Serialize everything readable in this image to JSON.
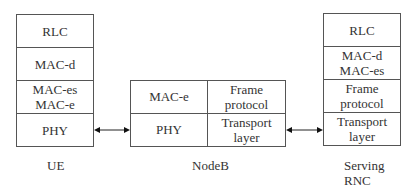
{
  "ue": {
    "layers": [
      "RLC",
      "MAC-d",
      "MAC-es\nMAC-e",
      "PHY"
    ],
    "label": "UE"
  },
  "nodeb": {
    "cells": {
      "top_left": "MAC-e",
      "top_right": "Frame\nprotocol",
      "bottom_left": "PHY",
      "bottom_right": "Transport\nlayer"
    },
    "label": "NodeB"
  },
  "rnc": {
    "layers": [
      "RLC",
      "MAC-d\nMAC-es",
      "Frame\nprotocol",
      "Transport\nlayer"
    ],
    "label": "Serving\nRNC"
  },
  "connections": [
    {
      "from": "UE PHY",
      "to": "NodeB PHY",
      "type": "bidirectional-arrow"
    },
    {
      "from": "NodeB Transport layer",
      "to": "Serving RNC Transport layer",
      "type": "bidirectional-arrow"
    }
  ]
}
